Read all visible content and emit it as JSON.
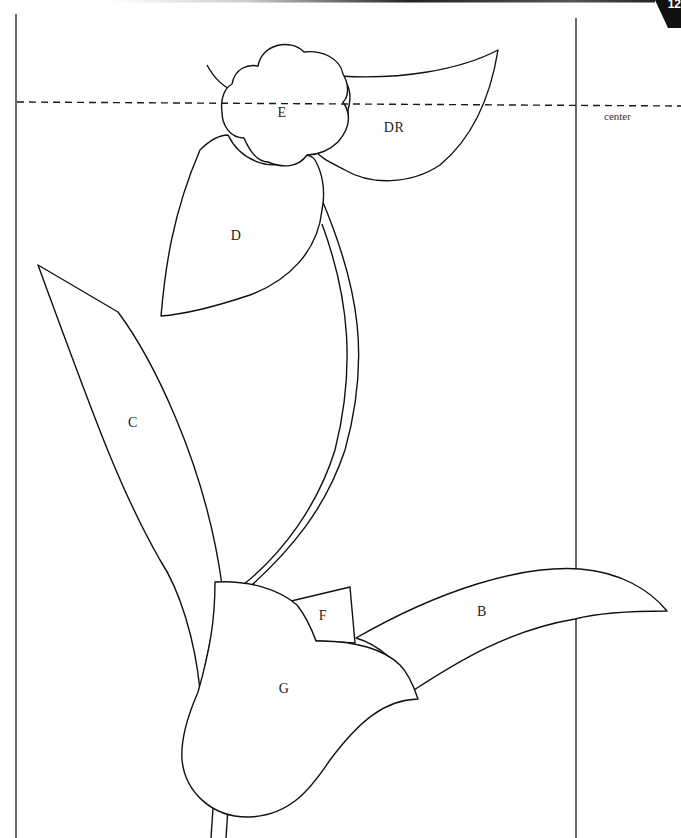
{
  "page": {
    "number": "12",
    "center_label": "center"
  },
  "pieces": {
    "B": "B",
    "C": "C",
    "D": "D",
    "DR": "DR",
    "E": "E",
    "F": "F",
    "G": "G"
  },
  "colors": {
    "line": "#111111",
    "background": "#ffffff"
  }
}
